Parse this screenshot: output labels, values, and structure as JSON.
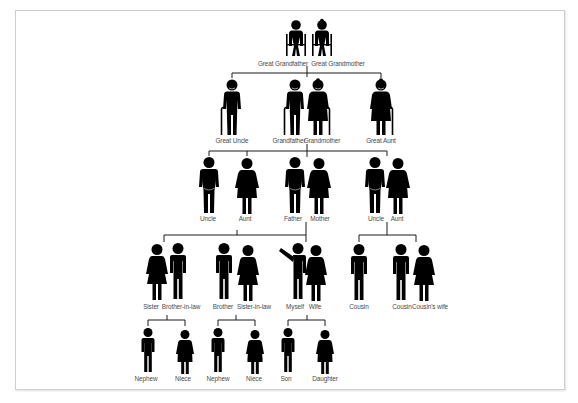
{
  "diagram": {
    "type": "family-tree",
    "colors": {
      "figure": "#000000",
      "line": "#1a1a1a",
      "label": "#4a4a4a",
      "frame": "#cfcfcf",
      "background": "#ffffff"
    },
    "generations": [
      {
        "row": 0,
        "members": [
          {
            "id": "great-grandfather",
            "label": "Great Grandfather",
            "figure": "elderly-man-wheelchair"
          },
          {
            "id": "great-grandmother",
            "label": "Great Grandmother",
            "figure": "elderly-woman-wheelchair"
          }
        ]
      },
      {
        "row": 1,
        "members": [
          {
            "id": "great-uncle",
            "label": "Great Uncle",
            "figure": "elderly-man-cane"
          },
          {
            "id": "grandfather",
            "label": "Grandfather",
            "figure": "elderly-man-cane"
          },
          {
            "id": "grandmother",
            "label": "Grandmother",
            "figure": "elderly-woman-cane"
          },
          {
            "id": "great-aunt",
            "label": "Great Aunt",
            "figure": "elderly-woman-cane"
          }
        ]
      },
      {
        "row": 2,
        "members": [
          {
            "id": "uncle-1",
            "label": "Uncle",
            "figure": "man-heavy"
          },
          {
            "id": "aunt-1",
            "label": "Aunt",
            "figure": "woman-heavy"
          },
          {
            "id": "father",
            "label": "Father",
            "figure": "man-heavy"
          },
          {
            "id": "mother",
            "label": "Mother",
            "figure": "woman-heavy"
          },
          {
            "id": "uncle-2",
            "label": "Uncle",
            "figure": "man-heavy"
          },
          {
            "id": "aunt-2",
            "label": "Aunt",
            "figure": "woman-heavy"
          }
        ]
      },
      {
        "row": 3,
        "members": [
          {
            "id": "sister",
            "label": "Sister",
            "figure": "woman"
          },
          {
            "id": "brother-in-law",
            "label": "Brother-in-law",
            "figure": "man"
          },
          {
            "id": "brother",
            "label": "Brother",
            "figure": "man"
          },
          {
            "id": "sister-in-law",
            "label": "Sister-in-law",
            "figure": "woman"
          },
          {
            "id": "myself",
            "label": "Myself",
            "figure": "man-waving"
          },
          {
            "id": "wife",
            "label": "Wife",
            "figure": "woman"
          },
          {
            "id": "cousin-1",
            "label": "Cousin",
            "figure": "man"
          },
          {
            "id": "cousin-2",
            "label": "Cousin",
            "figure": "man"
          },
          {
            "id": "cousins-wife",
            "label": "Cousin's wife",
            "figure": "woman"
          }
        ]
      },
      {
        "row": 4,
        "members": [
          {
            "id": "nephew-1",
            "label": "Nephew",
            "figure": "boy"
          },
          {
            "id": "niece-1",
            "label": "Niece",
            "figure": "girl"
          },
          {
            "id": "nephew-2",
            "label": "Nephew",
            "figure": "boy"
          },
          {
            "id": "niece-2",
            "label": "Niece",
            "figure": "girl"
          },
          {
            "id": "son",
            "label": "Son",
            "figure": "boy"
          },
          {
            "id": "daughter",
            "label": "Daughter",
            "figure": "girl"
          }
        ]
      }
    ],
    "connections": [
      {
        "parents": [
          "great-grandfather",
          "great-grandmother"
        ],
        "children": [
          "great-uncle",
          "grandfather",
          "great-aunt"
        ]
      },
      {
        "parents": [
          "grandfather",
          "grandmother"
        ],
        "children": [
          "uncle-1",
          "aunt-1",
          "father",
          "uncle-2"
        ]
      },
      {
        "parents": [
          "father",
          "mother"
        ],
        "children": [
          "sister",
          "brother",
          "myself"
        ]
      },
      {
        "parents": [
          "uncle-2",
          "aunt-2"
        ],
        "children": [
          "cousin-1",
          "cousin-2"
        ]
      },
      {
        "parents": [
          "sister",
          "brother-in-law"
        ],
        "children": [
          "nephew-1",
          "niece-1"
        ]
      },
      {
        "parents": [
          "brother",
          "sister-in-law"
        ],
        "children": [
          "nephew-2",
          "niece-2"
        ]
      },
      {
        "parents": [
          "myself",
          "wife"
        ],
        "children": [
          "son",
          "daughter"
        ]
      }
    ]
  }
}
